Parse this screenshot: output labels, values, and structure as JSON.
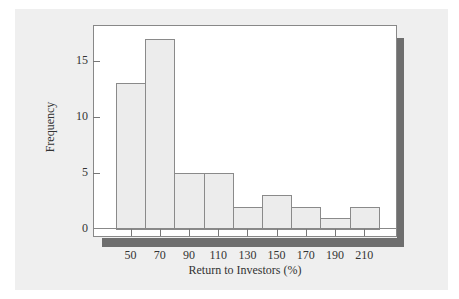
{
  "chart_data": {
    "type": "bar",
    "subtype": "histogram",
    "title": "",
    "xlabel": "Return to Investors (%)",
    "ylabel": "Frequency",
    "categories": [
      "50",
      "70",
      "90",
      "110",
      "130",
      "150",
      "170",
      "190",
      "210"
    ],
    "bin_centers": [
      50,
      70,
      90,
      110,
      130,
      150,
      170,
      190,
      210
    ],
    "bin_width": 20,
    "values": [
      13,
      17,
      5,
      5,
      2,
      3,
      2,
      1,
      2
    ],
    "yticks": [
      0,
      5,
      10,
      15
    ],
    "ylim": [
      0,
      18.5
    ],
    "grid": false,
    "legend": null
  },
  "labels": {
    "xlabel": "Return to Investors (%)",
    "ylabel": "Frequency",
    "yticks": [
      "0",
      "5",
      "10",
      "15"
    ],
    "xticks": [
      "50",
      "70",
      "90",
      "110",
      "130",
      "150",
      "170",
      "190",
      "210"
    ]
  },
  "colors": {
    "panel": "#efefef",
    "bar_fill": "#ececec",
    "bar_edge": "#8a8a8a",
    "shadow": "#6e6e6e"
  }
}
